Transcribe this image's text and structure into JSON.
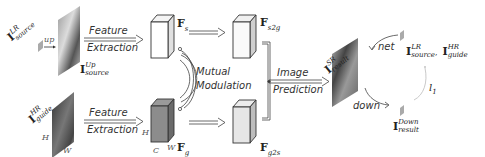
{
  "diagram": {
    "inputs": {
      "source": {
        "symbol": "I",
        "sup": "LR",
        "sub": "source",
        "op": "up"
      },
      "upsampled": {
        "symbol": "I",
        "sup": "Up",
        "sub": "source"
      },
      "guide": {
        "symbol": "I",
        "sup": "HR",
        "sub": "guide",
        "dims": {
          "h": "H",
          "w": "W"
        }
      }
    },
    "stages": {
      "feature_extraction": {
        "line1": "Feature",
        "line2": "Extraction"
      },
      "mutual_modulation": {
        "line1": "Mutual",
        "line2": "Modulation"
      },
      "image_prediction": {
        "line1": "Image",
        "line2": "Prediction"
      }
    },
    "features": {
      "fs": {
        "symbol": "F",
        "sub": "s"
      },
      "fg": {
        "symbol": "F",
        "sub": "g",
        "dims": {
          "h": "H",
          "c": "C",
          "w": "W"
        }
      },
      "fs2g": {
        "symbol": "F",
        "sub": "s2g"
      },
      "fg2s": {
        "symbol": "F",
        "sub": "g2s"
      }
    },
    "output": {
      "symbol": "I",
      "sup": "SR",
      "sub": "result"
    },
    "cycle": {
      "net_label": "net",
      "down_label": "down",
      "loss_label": "l",
      "loss_sub": "1",
      "inputs": {
        "a_sup": "LR",
        "a_sub": "source",
        "sep": ",",
        "b_sup": "HR",
        "b_sub": "guide"
      },
      "downsampled": {
        "symbol": "I",
        "sup": "Down",
        "sub": "result"
      }
    }
  }
}
